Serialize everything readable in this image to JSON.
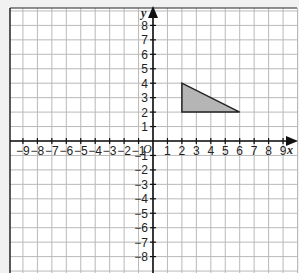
{
  "diagram": {
    "type": "coordinate-grid",
    "x_axis": {
      "label": "x",
      "min": -9,
      "max": 9,
      "tick_labels": [
        "-9",
        "-8",
        "-7",
        "-6",
        "-5",
        "-4",
        "-3",
        "-2",
        "-1",
        "1",
        "2",
        "3",
        "4",
        "5",
        "6",
        "7",
        "8",
        "9"
      ]
    },
    "y_axis": {
      "label": "y",
      "min": -8,
      "max": 8,
      "tick_labels": [
        "8",
        "7",
        "6",
        "5",
        "4",
        "3",
        "2",
        "1",
        "-1",
        "-2",
        "-3",
        "-4",
        "-5",
        "-6",
        "-7",
        "-8"
      ]
    },
    "origin_label": "O",
    "shapes": [
      {
        "name": "triangle",
        "vertices": [
          [
            2,
            4
          ],
          [
            2,
            2
          ],
          [
            6,
            2
          ]
        ],
        "fill": "#b5b5b5",
        "stroke": "#222222"
      }
    ],
    "colors": {
      "grid": "#b9b9b9",
      "axis": "#111111",
      "background": "#ffffff",
      "page": "#f1f1f1"
    }
  }
}
